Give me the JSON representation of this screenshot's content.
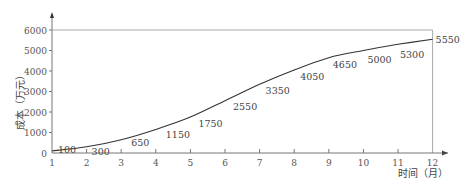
{
  "chart_data": {
    "type": "line",
    "title": "",
    "xlabel": "时间（月）",
    "ylabel": "成本（万元）",
    "x": [
      1,
      2,
      3,
      4,
      5,
      6,
      7,
      8,
      9,
      10,
      11,
      12
    ],
    "categories": [
      "1",
      "2",
      "3",
      "4",
      "5",
      "6",
      "7",
      "8",
      "9",
      "10",
      "11",
      "12"
    ],
    "series": [
      {
        "name": "累计成本",
        "values": [
          100,
          300,
          650,
          1150,
          1750,
          2550,
          3350,
          4050,
          4650,
          5000,
          5300,
          5550
        ]
      }
    ],
    "data_labels": [
      "100",
      "300",
      "650",
      "1150",
      "1750",
      "2550",
      "3350",
      "4050",
      "4650",
      "5000",
      "5300",
      "5550"
    ],
    "yticks": [
      0,
      1000,
      2000,
      3000,
      4000,
      5000,
      6000
    ],
    "ytick_labels": [
      "0",
      "1000",
      "2000",
      "3000",
      "4000",
      "5000",
      "6000"
    ],
    "xlim": [
      1,
      12
    ],
    "ylim": [
      0,
      6000
    ],
    "reference_line": {
      "y": 6000,
      "description": "horizontal line at 6000 from month 1 to 12 with vertical drop at month 12"
    },
    "grid": false,
    "legend": "none"
  },
  "colors": {
    "curve": "#333333",
    "axis": "#777777",
    "frame": "#aaaaaa"
  }
}
